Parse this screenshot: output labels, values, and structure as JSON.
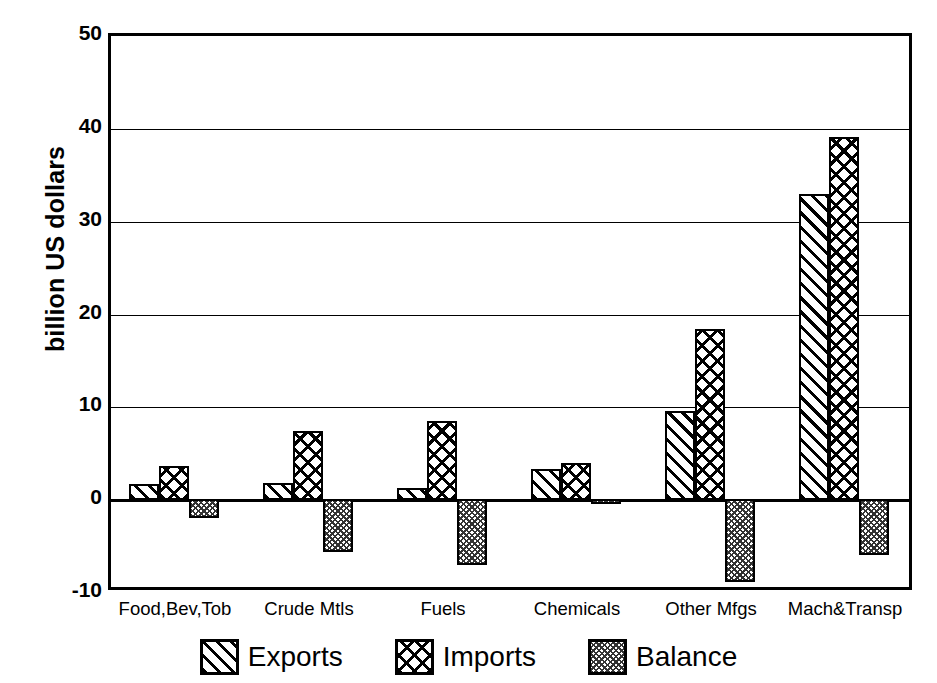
{
  "chart_data": {
    "type": "bar",
    "title": "",
    "xlabel": "",
    "ylabel": "billion US dollars",
    "ylim": [
      -10,
      50
    ],
    "yticks": [
      50,
      40,
      30,
      20,
      10,
      0,
      -10
    ],
    "ytick_labels": [
      "50",
      "40",
      "30",
      "20",
      "10",
      "0",
      "-10"
    ],
    "grid": true,
    "legend_position": "bottom",
    "categories": [
      "Food,Bev,Tob",
      "Crude Mtls",
      "Fuels",
      "Chemicals",
      "Other Mfgs",
      "Mach&Transp"
    ],
    "series": [
      {
        "name": "Exports",
        "pattern": "diagonal-hatch",
        "values": [
          1.7,
          1.9,
          1.3,
          3.4,
          9.6,
          33.0
        ]
      },
      {
        "name": "Imports",
        "pattern": "cross-hatch",
        "values": [
          3.7,
          7.5,
          8.5,
          4.0,
          18.4,
          39.1
        ]
      },
      {
        "name": "Balance",
        "pattern": "stipple",
        "values": [
          -2.1,
          -5.8,
          -7.2,
          -0.6,
          -9.0,
          -6.1
        ]
      }
    ]
  },
  "legend": {
    "items": [
      {
        "label": "Exports"
      },
      {
        "label": "Imports"
      },
      {
        "label": "Balance"
      }
    ]
  }
}
